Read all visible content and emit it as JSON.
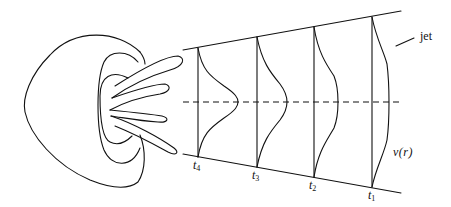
{
  "diagram": {
    "title": "",
    "labels": {
      "jet": "jet",
      "velocity_profile": "v(r)",
      "times": [
        {
          "name": "t",
          "sub": "4"
        },
        {
          "name": "t",
          "sub": "3"
        },
        {
          "name": "t",
          "sub": "2"
        },
        {
          "name": "t",
          "sub": "1"
        }
      ]
    },
    "elements": [
      "squid-body-outline",
      "mantle-opening",
      "tentacles",
      "jet-boundary-upper",
      "jet-boundary-lower",
      "jet-axis-dashed",
      "velocity-profiles"
    ],
    "colors": {
      "line": "#111111",
      "background": "#ffffff"
    }
  }
}
